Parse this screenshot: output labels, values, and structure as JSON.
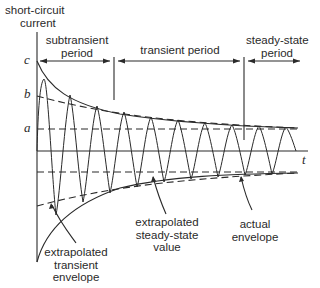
{
  "diagram": {
    "y_axis_label_line1": "short-circuit",
    "y_axis_label_line2": "current",
    "x_axis_label": "t",
    "levels": {
      "c": "c",
      "b": "b",
      "a": "a"
    },
    "periods": [
      {
        "line1": "subtransient",
        "line2": "period"
      },
      {
        "line1": "transient period",
        "line2": ""
      },
      {
        "line1": "steady-state",
        "line2": "period"
      }
    ],
    "annotations": {
      "extrapolated_transient": [
        "extrapolated",
        "transient",
        "envelope"
      ],
      "extrapolated_steady": [
        "extrapolated",
        "steady-state",
        "value"
      ],
      "actual_envelope": [
        "actual",
        "envelope"
      ]
    },
    "colors": {
      "ink": "#2a2a2a",
      "background": "#ffffff"
    }
  }
}
